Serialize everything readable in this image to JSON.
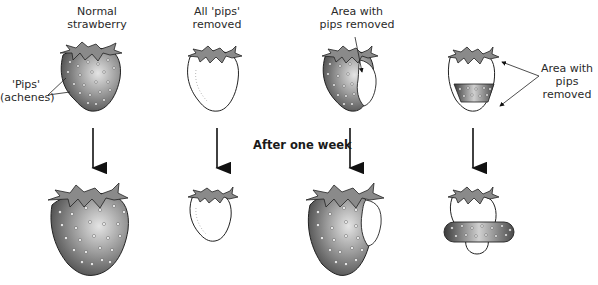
{
  "diagram": {
    "center_label": "After one week",
    "columns": [
      {
        "id": "normal",
        "top_label": [
          "Normal",
          "strawberry"
        ],
        "side_label": [
          "'Pips'",
          "(achenes)"
        ],
        "before": "whole strawberry covered with pips",
        "after": "larger strawberry, fully grown"
      },
      {
        "id": "all-removed",
        "top_label": [
          "All 'pips'",
          "removed"
        ],
        "before": "strawberry with no pips",
        "after": "strawberry does not grow"
      },
      {
        "id": "area-removed",
        "top_label": [
          "Area with",
          "pips removed"
        ],
        "before": "strawberry with a patch of pips removed",
        "after": "strawberry grows except in the patch"
      },
      {
        "id": "band-kept",
        "side_label": [
          "Area with",
          "pips removed"
        ],
        "before": "strawberry with only a band of pips",
        "after": "only the band region grows"
      }
    ]
  },
  "colors": {
    "fruit_dark": "#3a3a3a",
    "fruit_light": "#d8d8d8",
    "leaf": "#8a8a8a",
    "outline": "#1a1a1a",
    "pip": "#ffffff"
  }
}
